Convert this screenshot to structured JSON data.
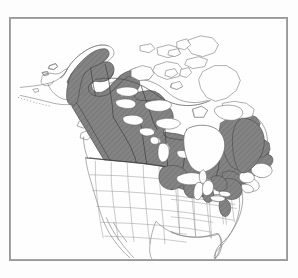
{
  "figure": {
    "type": "range-map",
    "title": "",
    "caption": "",
    "region": "North America",
    "projection": "conic",
    "background_color": "#ffffff",
    "frame": {
      "visible": true,
      "color": "#9b9b9b",
      "width_px": 279,
      "height_px": 244,
      "left_px": 9,
      "top_px": 17
    }
  },
  "map": {
    "coastline_color": "#7a7a7a",
    "boundary_color": "#8d8d8d",
    "shaded_range_color": "#808080",
    "shaded_range_stroke": "#4a4a4a",
    "unshaded_color": "#ffffff",
    "lake_color": "#ffffff",
    "hatch_pattern": "diagonal-fine",
    "labels": []
  },
  "legend": {
    "visible": false,
    "entries": [
      {
        "swatch_color": "#808080",
        "label": "Breeding / resident range"
      },
      {
        "swatch_color": "#ffffff",
        "label": "Outside range"
      }
    ]
  },
  "range_description": {
    "shaded_regions": [
      "Interior and eastern Alaska",
      "Yukon",
      "Northwest Territories (mainland)",
      "British Columbia",
      "Alberta",
      "Saskatchewan",
      "Manitoba",
      "Ontario (north of Great Lakes)",
      "Quebec",
      "Labrador",
      "Newfoundland (partial)",
      "Northern Minnesota",
      "Northern Wisconsin",
      "Michigan",
      "New England",
      "Appalachian Mountains",
      "Rocky Mountains (Idaho, Montana, Wyoming, Utah, Colorado patches)",
      "Cascade Range (Washington, Oregon)"
    ],
    "unshaded_regions": [
      "Western Alaska coast",
      "Aleutian Islands",
      "Arctic Archipelago",
      "Hudson Bay",
      "Baffin Island",
      "Great Plains (United States)",
      "Southwestern United States",
      "Southeastern United States",
      "Gulf Coast",
      "Florida",
      "Mexico"
    ]
  }
}
